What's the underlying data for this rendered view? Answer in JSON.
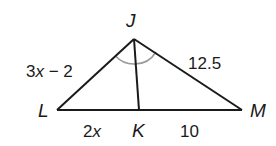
{
  "figure": {
    "type": "triangle with angle bisector",
    "vertices": {
      "J": {
        "label": "J",
        "x": 134,
        "y": 39
      },
      "L": {
        "label": "L",
        "x": 57,
        "y": 110
      },
      "K": {
        "label": "K",
        "x": 139,
        "y": 110
      },
      "M": {
        "label": "M",
        "x": 242,
        "y": 110
      }
    },
    "segments": {
      "JL": {
        "label_pre": "3",
        "label_var": "x",
        "label_post": " − 2"
      },
      "JM": {
        "label": "12.5"
      },
      "LK": {
        "label_pre": "2",
        "label_var": "x"
      },
      "KM": {
        "label": "10"
      }
    },
    "angle_marks": {
      "description": "Angle LJK congruent to angle KJM (JK bisects angle LJM)",
      "color": "#9a9a9a"
    },
    "colors": {
      "line": "#1a1a1a",
      "arc": "#9a9a9a"
    }
  }
}
